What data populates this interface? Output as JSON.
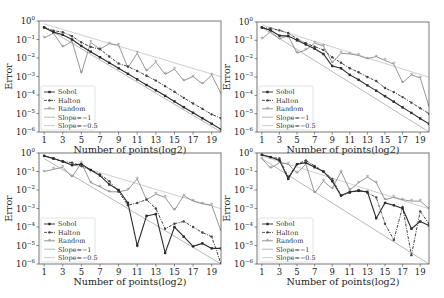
{
  "chart_data": [
    {
      "type": "line",
      "panel": "top-left",
      "xlabel": "Number of points(log2)",
      "ylabel": "Error",
      "yscale": "log",
      "ylim": [
        1e-06,
        1
      ],
      "xlim": [
        0.5,
        20
      ],
      "xticks": [
        1,
        3,
        5,
        7,
        9,
        11,
        13,
        15,
        17,
        19
      ],
      "yticks": [
        "10^0",
        "10^-1",
        "10^-2",
        "10^-3",
        "10^-4",
        "10^-5",
        "10^-6"
      ],
      "legend": [
        "Sobol",
        "Halton",
        "Random",
        "Slope=−1",
        "Slope=−0.5"
      ],
      "legend_position": "lower left",
      "x": [
        1,
        2,
        3,
        4,
        5,
        6,
        7,
        8,
        9,
        10,
        11,
        12,
        13,
        14,
        15,
        16,
        17,
        18,
        19,
        20
      ],
      "series": [
        {
          "name": "Sobol",
          "style": "solid-dark",
          "values": [
            0.45,
            0.25,
            0.18,
            0.1,
            0.045,
            0.022,
            0.011,
            0.0055,
            0.0028,
            0.0014,
            0.0007,
            0.00035,
            0.00018,
            9e-05,
            4.5e-05,
            2.2e-05,
            1.1e-05,
            5.5e-06,
            2.8e-06,
            1.4e-06
          ]
        },
        {
          "name": "Halton",
          "style": "dashdot-dark",
          "values": [
            0.45,
            0.3,
            0.25,
            0.15,
            0.07,
            0.04,
            0.03,
            0.012,
            0.005,
            0.0035,
            0.002,
            0.0011,
            0.0006,
            0.0003,
            0.00015,
            7e-05,
            3.5e-05,
            1.8e-05,
            9e-06,
            5.5e-06
          ]
        },
        {
          "name": "Random",
          "style": "solid-gray",
          "values": [
            0.12,
            0.22,
            0.04,
            0.08,
            0.0015,
            0.07,
            0.03,
            0.06,
            0.05,
            0.003,
            0.018,
            0.002,
            0.006,
            0.0013,
            0.0025,
            0.0006,
            0.001,
            0.0004,
            0.0012,
            0.00012
          ]
        },
        {
          "name": "Slope=−1",
          "style": "solid-lightgray",
          "reference": true
        },
        {
          "name": "Slope=−0.5",
          "style": "solid-lightgray",
          "reference": true
        }
      ]
    },
    {
      "type": "line",
      "panel": "top-right",
      "xlabel": "Number of points(log2)",
      "ylabel": "Error",
      "yscale": "log",
      "ylim": [
        1e-06,
        1
      ],
      "xticks": [
        1,
        3,
        5,
        7,
        9,
        11,
        13,
        15,
        17,
        19
      ],
      "yticks": [
        "10^0",
        "10^-1",
        "10^-2",
        "10^-3",
        "10^-4",
        "10^-5",
        "10^-6"
      ],
      "legend": [
        "Sobol",
        "Halton",
        "Random",
        "Slope=−1",
        "Slope=−0.5"
      ],
      "legend_position": "lower left",
      "x": [
        1,
        2,
        3,
        4,
        5,
        6,
        7,
        8,
        9,
        10,
        11,
        12,
        13,
        14,
        15,
        16,
        17,
        18,
        19,
        20
      ],
      "series": [
        {
          "name": "Sobol",
          "values": [
            0.5,
            0.35,
            0.18,
            0.17,
            0.1,
            0.06,
            0.035,
            0.018,
            0.004,
            0.003,
            0.0013,
            0.0007,
            0.00035,
            0.00018,
            9e-05,
            4.5e-05,
            2.2e-05,
            1.1e-05,
            5.5e-06,
            2.8e-06
          ]
        },
        {
          "name": "Halton",
          "values": [
            0.5,
            0.45,
            0.35,
            0.25,
            0.12,
            0.07,
            0.045,
            0.03,
            0.012,
            0.006,
            0.003,
            0.0018,
            0.001,
            0.0006,
            0.00025,
            0.00015,
            8e-05,
            4e-05,
            2e-05,
            1e-05
          ]
        },
        {
          "name": "Random",
          "values": [
            0.12,
            0.3,
            0.12,
            0.18,
            0.02,
            0.03,
            0.07,
            0.05,
            0.006,
            0.02,
            0.018,
            0.015,
            0.01,
            0.013,
            0.008,
            0.005,
            0.0005,
            0.0013,
            0.0009,
            2.5e-05
          ]
        },
        {
          "name": "Slope=−1",
          "reference": true
        },
        {
          "name": "Slope=−0.5",
          "reference": true
        }
      ]
    },
    {
      "type": "line",
      "panel": "bottom-left",
      "xlabel": "Number of points(log2)",
      "ylabel": "Error",
      "yscale": "log",
      "ylim": [
        1e-06,
        1
      ],
      "xticks": [
        1,
        3,
        5,
        7,
        9,
        11,
        13,
        15,
        17,
        19
      ],
      "yticks": [
        "10^0",
        "10^-1",
        "10^-2",
        "10^-3",
        "10^-4",
        "10^-5",
        "10^-6"
      ],
      "legend": [
        "Sobol",
        "Halton",
        "Random",
        "Slope=−1",
        "Slope=−0.5"
      ],
      "legend_position": "lower left",
      "x": [
        1,
        2,
        3,
        4,
        5,
        6,
        7,
        8,
        9,
        10,
        11,
        12,
        13,
        14,
        15,
        16,
        17,
        18,
        19,
        20
      ],
      "series": [
        {
          "name": "Sobol",
          "values": [
            0.7,
            0.5,
            0.35,
            0.22,
            0.25,
            0.12,
            0.06,
            0.02,
            0.01,
            0.002,
            1e-05,
            0.0004,
            0.0005,
            4e-06,
            0.0001,
            3e-05,
            9e-06,
            1.3e-05,
            7e-06,
            7e-06
          ]
        },
        {
          "name": "Halton",
          "values": [
            0.7,
            0.5,
            0.35,
            0.3,
            0.2,
            0.12,
            0.07,
            0.03,
            0.008,
            0.0015,
            0.002,
            0.003,
            0.001,
            8e-05,
            0.00015,
            0.0002,
            0.0001,
            5e-05,
            3e-05,
            1e-06
          ]
        },
        {
          "name": "Random",
          "values": [
            0.1,
            0.13,
            0.17,
            0.05,
            0.3,
            0.025,
            0.015,
            0.008,
            0.008,
            0.01,
            0.04,
            0.003,
            0.006,
            0.004,
            0.0008,
            0.005,
            0.0025,
            0.0018,
            0.0015,
            6e-05
          ]
        },
        {
          "name": "Slope=−1",
          "reference": true
        },
        {
          "name": "Slope=−0.5",
          "reference": true
        }
      ]
    },
    {
      "type": "line",
      "panel": "bottom-right",
      "xlabel": "Number of points(log2)",
      "ylabel": "Error",
      "yscale": "log",
      "ylim": [
        1e-06,
        1
      ],
      "xticks": [
        1,
        3,
        5,
        7,
        9,
        11,
        13,
        15,
        17,
        19
      ],
      "yticks": [
        "10^0",
        "10^-1",
        "10^-2",
        "10^-3",
        "10^-4",
        "10^-5",
        "10^-6"
      ],
      "legend": [
        "Sobol",
        "Halton",
        "Random",
        "Slope=−1",
        "Slope=−0.5"
      ],
      "legend_position": "lower left",
      "x": [
        1,
        2,
        3,
        4,
        5,
        6,
        7,
        8,
        9,
        10,
        11,
        12,
        13,
        14,
        15,
        16,
        17,
        18,
        19,
        20
      ],
      "series": [
        {
          "name": "Sobol",
          "values": [
            0.8,
            0.6,
            0.4,
            0.04,
            0.25,
            0.3,
            0.17,
            0.1,
            0.03,
            0.005,
            0.008,
            0.009,
            0.008,
            0.0003,
            0.002,
            0.0015,
            0.001,
            8e-05,
            0.0002,
            0.00012
          ]
        },
        {
          "name": "Halton",
          "values": [
            0.8,
            0.6,
            0.5,
            0.05,
            0.25,
            0.4,
            0.2,
            0.1,
            0.04,
            0.005,
            0.007,
            0.01,
            0.007,
            0.004,
            0.00015,
            2e-05,
            0.0012,
            3e-06,
            0.0007,
            0.00015
          ]
        },
        {
          "name": "Random",
          "values": [
            0.5,
            0.15,
            0.3,
            0.25,
            0.08,
            0.25,
            0.007,
            0.03,
            0.012,
            0.1,
            0.01,
            0.025,
            0.05,
            0.025,
            0.003,
            0.004,
            0.003,
            0.0025,
            0.0025,
            0.001
          ]
        },
        {
          "name": "Slope=−1",
          "reference": true
        },
        {
          "name": "Slope=−0.5",
          "reference": true
        }
      ]
    }
  ],
  "labels": {
    "xlabel": "Number of points(log2)",
    "ylabel": "Error",
    "legend": [
      "Sobol",
      "Halton",
      "Random",
      "Slope=−1",
      "Slope=−0.5"
    ],
    "xtick_labels": [
      "1",
      "3",
      "5",
      "7",
      "9",
      "11",
      "13",
      "15",
      "17",
      "19"
    ]
  },
  "colors": {
    "sobol": "#2b2b2b",
    "halton": "#444444",
    "random": "#8a8a8a",
    "slope1": "#b0b0b0",
    "slope05": "#c8c8c8",
    "frame": "#555555"
  }
}
